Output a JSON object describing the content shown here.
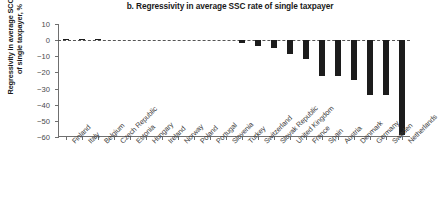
{
  "chart_data": {
    "type": "bar",
    "title": "b. Regressivity in average SSC rate of single taxpayer",
    "xlabel": "",
    "ylabel": "Regressivity in average SCC rate\nof single taxpayer, %",
    "ylim": [
      -60,
      10
    ],
    "yticks": [
      10,
      0,
      -10,
      -20,
      -30,
      -40,
      -50,
      -60
    ],
    "ytick_labels": [
      "10",
      "0",
      "−10",
      "−20",
      "−30",
      "−40",
      "−50",
      "−60"
    ],
    "grid": false,
    "legend": false,
    "zero_reference_line": true,
    "bar_color": "#1c1c1c",
    "categories": [
      "Finland",
      "Italy",
      "Belgium",
      "Czech Republic",
      "Estonia",
      "Hungary",
      "Ireland",
      "Norway",
      "Poland",
      "Portugal",
      "Slovenia",
      "Turkey",
      "Switzerland",
      "Slovak Republic",
      "United Kingdom",
      "France",
      "Spain",
      "Austria",
      "Denmark",
      "Germany",
      "Sweden",
      "Netherlands"
    ],
    "values": [
      0.9,
      0.4,
      0.5,
      0.0,
      0.0,
      0.0,
      0.0,
      0.0,
      0.0,
      0.0,
      0.0,
      -1.5,
      -3.5,
      -5.0,
      -8.5,
      -11.5,
      -22.0,
      -22.0,
      -24.5,
      -34.0,
      -34.0,
      -58.5
    ]
  }
}
